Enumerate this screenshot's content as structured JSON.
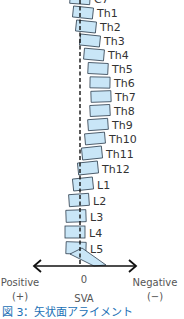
{
  "diagram": {
    "type": "sagittal-spine-alignment",
    "colors": {
      "vertebra_fill": "#c9e6f7",
      "vertebra_stroke": "#2f3f4f",
      "line": "#111111",
      "caption": "#1a6fb5"
    },
    "vertebrae": [
      {
        "label": "C7",
        "x": 70,
        "y": -6,
        "w": 20,
        "h": 10,
        "rot": 4
      },
      {
        "label": "Th1",
        "x": 73,
        "y": 7,
        "w": 20,
        "h": 11,
        "rot": 6
      },
      {
        "label": "Th2",
        "x": 76,
        "y": 21,
        "w": 20,
        "h": 11,
        "rot": 6
      },
      {
        "label": "Th3",
        "x": 80,
        "y": 35,
        "w": 20,
        "h": 11,
        "rot": 6
      },
      {
        "label": "Th4",
        "x": 84,
        "y": 49,
        "w": 20,
        "h": 11,
        "rot": 5
      },
      {
        "label": "Th5",
        "x": 88,
        "y": 63,
        "w": 20,
        "h": 11,
        "rot": 3
      },
      {
        "label": "Th6",
        "x": 90,
        "y": 77,
        "w": 20,
        "h": 11,
        "rot": 1
      },
      {
        "label": "Th7",
        "x": 91,
        "y": 91,
        "w": 20,
        "h": 11,
        "rot": -2
      },
      {
        "label": "Th8",
        "x": 90,
        "y": 105,
        "w": 20,
        "h": 11,
        "rot": -3
      },
      {
        "label": "Th9",
        "x": 88,
        "y": 119,
        "w": 20,
        "h": 11,
        "rot": -4
      },
      {
        "label": "Th10",
        "x": 85,
        "y": 133,
        "w": 20,
        "h": 11,
        "rot": -5
      },
      {
        "label": "Th11",
        "x": 82,
        "y": 147,
        "w": 20,
        "h": 12,
        "rot": -6
      },
      {
        "label": "Th12",
        "x": 78,
        "y": 162,
        "w": 20,
        "h": 12,
        "rot": -6
      },
      {
        "label": "L1",
        "x": 73,
        "y": 178,
        "w": 20,
        "h": 12,
        "rot": -6
      },
      {
        "label": "L2",
        "x": 69,
        "y": 194,
        "w": 20,
        "h": 12,
        "rot": -4
      },
      {
        "label": "L3",
        "x": 66,
        "y": 210,
        "w": 20,
        "h": 12,
        "rot": -2
      },
      {
        "label": "L4",
        "x": 65,
        "y": 226,
        "w": 20,
        "h": 12,
        "rot": 0
      },
      {
        "label": "L5",
        "x": 66,
        "y": 242,
        "w": 20,
        "h": 12,
        "rot": 2
      }
    ],
    "sacrum": {
      "points": "70,254 82,248 106,265 94,266"
    },
    "plumb_line": {
      "x": 80,
      "y1": 0,
      "y2": 266
    },
    "axis": {
      "y": 266,
      "x1": 34,
      "x2": 136
    },
    "labels": {
      "positive": "Positive",
      "positive_sign": "(+)",
      "zero": "0",
      "negative": "Negative",
      "negative_sign": "(−)",
      "sva": "SVA"
    }
  },
  "caption": "図 3：矢状面アライメント"
}
